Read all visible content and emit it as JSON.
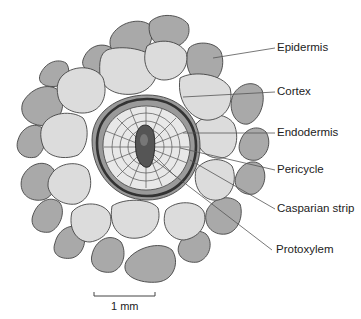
{
  "diagram": {
    "type": "root-cross-section",
    "labels": [
      {
        "id": "epidermis",
        "text": "Epidermis"
      },
      {
        "id": "cortex",
        "text": "Cortex"
      },
      {
        "id": "endodermis",
        "text": "Endodermis"
      },
      {
        "id": "pericycle",
        "text": "Pericycle"
      },
      {
        "id": "casparian",
        "text": "Casparian strip"
      },
      {
        "id": "protoxylem",
        "text": "Protoxylem"
      }
    ],
    "scale_bar": {
      "text": "1 mm"
    },
    "colors": {
      "epidermis_fill": "#a9a9a9",
      "cortex_fill": "#dcdcdc",
      "endodermis_fill": "#9a9a9a",
      "stele_fill": "#e8e8e8",
      "casparian_ring": "#3a3a3a",
      "xylem_fill": "#555555",
      "outline": "#444444",
      "leader": "#555555"
    }
  }
}
